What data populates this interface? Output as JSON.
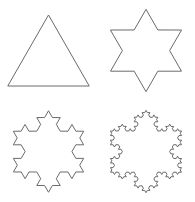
{
  "figure": {
    "background_color": "#ffffff",
    "stroke_color": "#6a6a6a",
    "stroke_width": 1,
    "layout": {
      "rows": 2,
      "columns": 2,
      "cell_width": 97,
      "cell_height": 101
    }
  },
  "chart_data": {
    "type": "diagram",
    "grid": {
      "rows": 2,
      "columns": 2
    },
    "panels": [
      {
        "index": 0,
        "name": "koch-iteration-0",
        "label": "Iteration 0",
        "shape": "equilateral-triangle",
        "iteration": 0,
        "segments": 3,
        "vertices": 3,
        "position": {
          "row": 0,
          "column": 0
        },
        "bounds_px": {
          "x": 14,
          "y": 12,
          "width": 68,
          "height": 61
        },
        "seed_polygon": [
          {
            "x": 0.5,
            "y": 0.07
          },
          {
            "x": 0.93,
            "y": 0.82
          },
          {
            "x": 0.07,
            "y": 0.82
          }
        ],
        "orientation": "apex-up"
      },
      {
        "index": 1,
        "name": "koch-iteration-1",
        "label": "Iteration 1",
        "shape": "hexagram-star",
        "iteration": 1,
        "segments": 12,
        "vertices": 12,
        "position": {
          "row": 0,
          "column": 1
        },
        "bounds_px": {
          "x": 121,
          "y": 8,
          "width": 65,
          "height": 75
        },
        "seed_polygon": [
          {
            "x": 0.5,
            "y": 0.07
          },
          {
            "x": 0.93,
            "y": 0.82
          },
          {
            "x": 0.07,
            "y": 0.82
          }
        ],
        "orientation": "apex-up"
      },
      {
        "index": 2,
        "name": "koch-iteration-2",
        "label": "Iteration 2",
        "shape": "koch-snowflake",
        "iteration": 2,
        "segments": 48,
        "vertices": 48,
        "position": {
          "row": 1,
          "column": 0
        },
        "bounds_px": {
          "x": 14,
          "y": 110,
          "width": 70,
          "height": 80
        },
        "seed_polygon": [
          {
            "x": 0.5,
            "y": 0.07
          },
          {
            "x": 0.93,
            "y": 0.82
          },
          {
            "x": 0.07,
            "y": 0.82
          }
        ],
        "orientation": "apex-up"
      },
      {
        "index": 3,
        "name": "koch-iteration-3",
        "label": "Iteration 3",
        "shape": "koch-snowflake",
        "iteration": 3,
        "segments": 192,
        "vertices": 192,
        "position": {
          "row": 1,
          "column": 1
        },
        "bounds_px": {
          "x": 118,
          "y": 110,
          "width": 70,
          "height": 80
        },
        "seed_polygon": [
          {
            "x": 0.5,
            "y": 0.07
          },
          {
            "x": 0.93,
            "y": 0.82
          },
          {
            "x": 0.07,
            "y": 0.82
          }
        ],
        "orientation": "apex-up"
      }
    ]
  }
}
